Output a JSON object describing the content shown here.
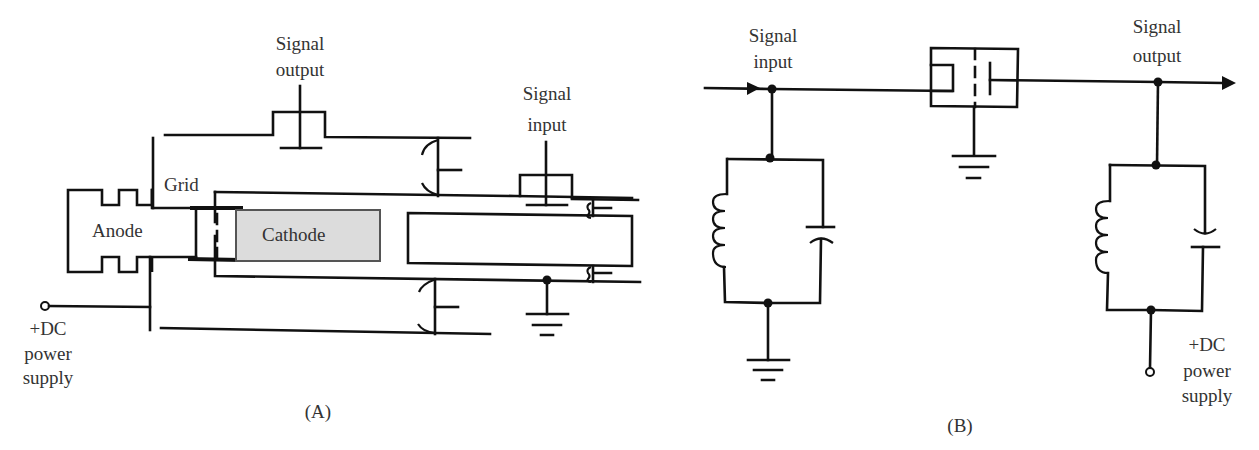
{
  "panel_a": {
    "caption": "(A)",
    "labels": {
      "signal_output_1": "Signal",
      "signal_output_2": "output",
      "signal_input_1": "Signal",
      "signal_input_2": "input",
      "grid": "Grid",
      "anode": "Anode",
      "cathode": "Cathode",
      "dc_1": "+DC",
      "dc_2": "power",
      "dc_3": "supply"
    }
  },
  "panel_b": {
    "caption": "(B)",
    "labels": {
      "signal_input_1": "Signal",
      "signal_input_2": "input",
      "signal_output_1": "Signal",
      "signal_output_2": "output",
      "dc_1": "+DC",
      "dc_2": "power",
      "dc_3": "supply"
    }
  },
  "colors": {
    "line": "#111111",
    "text": "#333333",
    "cathode_fill": "#dcdcdc"
  }
}
